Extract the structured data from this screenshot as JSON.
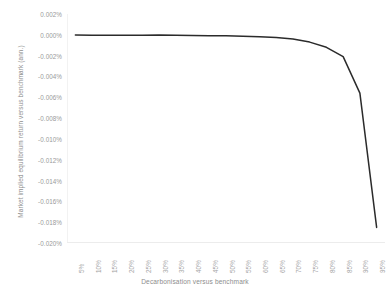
{
  "chart_data": {
    "type": "line",
    "title": "",
    "xlabel": "Decarbonisation versus benchmark",
    "ylabel": "Market implied equilibrium return versus benchmark (ann.)",
    "categories": [
      "5%",
      "10%",
      "15%",
      "20%",
      "25%",
      "30%",
      "35%",
      "40%",
      "45%",
      "50%",
      "55%",
      "60%",
      "65%",
      "70%",
      "75%",
      "80%",
      "85%",
      "90%",
      "95%"
    ],
    "series": [
      {
        "name": "Market implied equilibrium return versus benchmark",
        "color": "#2b2b2b",
        "values": [
          -2e-05,
          -3e-05,
          -4e-05,
          -5e-05,
          -4e-05,
          -2e-05,
          -4e-05,
          -6e-05,
          -8e-05,
          -0.0001,
          -0.00014,
          -0.00018,
          -0.00026,
          -0.0004,
          -0.0007,
          -0.0012,
          -0.0021,
          -0.0056,
          -0.0185
        ]
      }
    ],
    "ylim": [
      -0.02,
      0.002
    ],
    "yticks": [
      "0.002%",
      "0.000%",
      "-0.002%",
      "-0.004%",
      "-0.006%",
      "-0.008%",
      "-0.010%",
      "-0.012%",
      "-0.014%",
      "-0.016%",
      "-0.018%",
      "-0.020%"
    ],
    "ytick_values": [
      0.002,
      0.0,
      -0.002,
      -0.004,
      -0.006,
      -0.008,
      -0.01,
      -0.012,
      -0.014,
      -0.016,
      -0.018,
      -0.02
    ],
    "grid": false,
    "legend": "none",
    "units": "percent",
    "value_unit_note": "values expressed in percent (same unit as y tick labels)"
  },
  "axes": {
    "y_title": "Market implied equilibrium return versus benchmark (ann.)",
    "x_title": "Decarbonisation versus benchmark"
  },
  "colors": {
    "line": "#2b2b2b",
    "tick_text": "#9a9a9a",
    "axis_title_text": "#8d8d8d",
    "axis_rule": "#ececec",
    "background": "#ffffff"
  }
}
